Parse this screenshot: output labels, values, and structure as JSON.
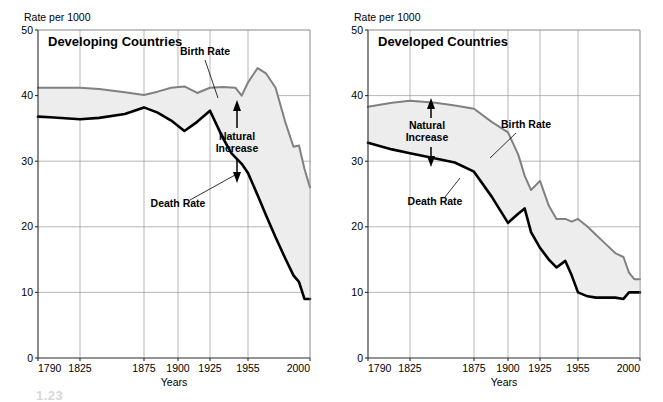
{
  "figure": {
    "background_color": "#ffffff",
    "width": 663,
    "height": 402,
    "partial_caption": "1.23"
  },
  "style": {
    "birth_rate_color": "#808080",
    "death_rate_color": "#000000",
    "natural_increase_fill": "#ededed",
    "grid_color": "#9a9a9a",
    "axis_color": "#2b2b2b"
  },
  "chart_data": [
    {
      "id": "developing",
      "type": "area",
      "title": "Developing Countries",
      "xlabel": "Years",
      "ylabel": "Rate per 1000",
      "ylim": [
        0,
        50
      ],
      "yticks": [
        0,
        10,
        20,
        30,
        40,
        50
      ],
      "ytick_labels": [
        "0",
        "10",
        "20",
        "30",
        "40",
        "50"
      ],
      "xticks": [
        1790,
        1825,
        1875,
        1900,
        1925,
        1955,
        2000
      ],
      "xtick_labels": [
        "1790",
        "1825",
        "1875",
        "1900",
        "1925",
        "1955",
        "2000"
      ],
      "grid": true,
      "legend_position": "inline-annotations",
      "annotations": [
        {
          "label": "Birth Rate",
          "points_to_series": "Birth Rate"
        },
        {
          "label": "Death Rate",
          "points_to_series": "Death Rate"
        },
        {
          "label": "Natural Increase",
          "describes": "gap between Birth Rate and Death Rate"
        }
      ],
      "series": [
        {
          "name": "Birth Rate",
          "color": "#808080",
          "x": [
            1790,
            1800,
            1825,
            1840,
            1860,
            1875,
            1885,
            1895,
            1905,
            1915,
            1925,
            1935,
            1945,
            1950,
            1955,
            1962,
            1968,
            1975,
            1982,
            1988,
            1992,
            1996,
            2000
          ],
          "values": [
            41.2,
            41.2,
            41.2,
            41.0,
            40.5,
            40.1,
            40.6,
            41.2,
            41.4,
            40.4,
            41.2,
            41.3,
            41.2,
            40.0,
            42.0,
            44.2,
            43.4,
            41.2,
            36.0,
            32.2,
            32.4,
            28.8,
            26.0
          ]
        },
        {
          "name": "Death Rate",
          "color": "#000000",
          "x": [
            1790,
            1800,
            1825,
            1840,
            1860,
            1875,
            1885,
            1895,
            1905,
            1915,
            1925,
            1935,
            1942,
            1950,
            1955,
            1962,
            1968,
            1975,
            1982,
            1988,
            1992,
            1996,
            2000
          ],
          "values": [
            36.8,
            36.7,
            36.4,
            36.6,
            37.2,
            38.2,
            37.4,
            36.2,
            34.6,
            36.0,
            37.7,
            33.6,
            31.2,
            29.6,
            28.2,
            24.8,
            21.8,
            18.4,
            15.2,
            12.6,
            11.6,
            9.0,
            9.0
          ]
        }
      ]
    },
    {
      "id": "developed",
      "type": "area",
      "title": "Developed Countries",
      "xlabel": "Years",
      "ylabel": "Rate per 1000",
      "ylim": [
        0,
        50
      ],
      "yticks": [
        0,
        10,
        20,
        30,
        40,
        50
      ],
      "ytick_labels": [
        "0",
        "10",
        "20",
        "30",
        "40",
        "50"
      ],
      "xticks": [
        1790,
        1825,
        1875,
        1900,
        1925,
        1955,
        2000
      ],
      "xtick_labels": [
        "1790",
        "1825",
        "1875",
        "1900",
        "1925",
        "1955",
        "2000"
      ],
      "grid": true,
      "legend_position": "inline-annotations",
      "annotations": [
        {
          "label": "Birth Rate",
          "points_to_series": "Birth Rate"
        },
        {
          "label": "Death Rate",
          "points_to_series": "Death Rate"
        },
        {
          "label": "Natural Increase",
          "describes": "gap between Birth Rate and Death Rate"
        }
      ],
      "series": [
        {
          "name": "Birth Rate",
          "color": "#808080",
          "x": [
            1790,
            1810,
            1825,
            1845,
            1860,
            1875,
            1888,
            1900,
            1908,
            1913,
            1918,
            1925,
            1932,
            1938,
            1945,
            1950,
            1955,
            1962,
            1968,
            1975,
            1982,
            1988,
            1992,
            1996,
            2000
          ],
          "values": [
            38.3,
            38.9,
            39.2,
            38.9,
            38.5,
            38.0,
            36.0,
            34.4,
            31.0,
            27.8,
            25.6,
            27.0,
            23.2,
            21.2,
            21.2,
            20.8,
            21.2,
            20.0,
            18.8,
            17.4,
            16.0,
            15.4,
            13.0,
            12.0,
            12.0
          ]
        },
        {
          "name": "Death Rate",
          "color": "#000000",
          "x": [
            1790,
            1810,
            1825,
            1845,
            1860,
            1875,
            1888,
            1900,
            1908,
            1913,
            1918,
            1925,
            1932,
            1938,
            1945,
            1950,
            1955,
            1962,
            1968,
            1975,
            1982,
            1988,
            1992,
            1996,
            2000
          ],
          "values": [
            32.8,
            31.8,
            31.2,
            30.4,
            29.8,
            28.4,
            24.6,
            20.6,
            22.0,
            22.8,
            19.2,
            16.8,
            15.0,
            13.8,
            14.8,
            12.6,
            10.0,
            9.4,
            9.2,
            9.2,
            9.2,
            9.0,
            10.0,
            10.0,
            10.0
          ]
        }
      ]
    }
  ]
}
